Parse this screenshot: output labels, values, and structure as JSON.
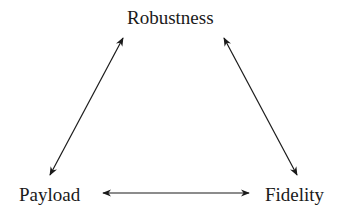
{
  "diagram": {
    "nodes": [
      {
        "id": "robustness",
        "label": "Robustness"
      },
      {
        "id": "payload",
        "label": "Payload"
      },
      {
        "id": "fidelity",
        "label": "Fidelity"
      }
    ],
    "edges": [
      {
        "from": "robustness",
        "to": "payload",
        "type": "bidirectional"
      },
      {
        "from": "robustness",
        "to": "fidelity",
        "type": "bidirectional"
      },
      {
        "from": "payload",
        "to": "fidelity",
        "type": "bidirectional"
      }
    ],
    "colors": {
      "stroke": "#1a1a1a",
      "background": "#ffffff"
    }
  }
}
